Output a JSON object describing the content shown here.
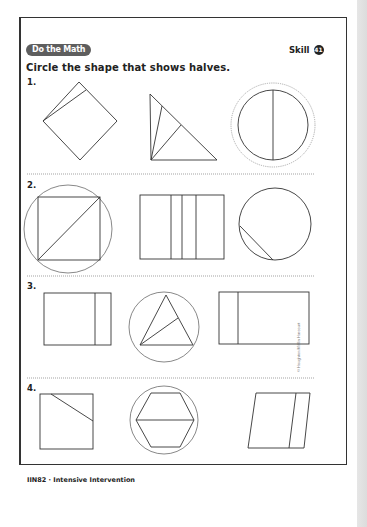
{
  "header": {
    "badge_label": "Do the Math",
    "skill_label": "Skill",
    "skill_number": "41"
  },
  "instructions": "Circle the shape that shows halves.",
  "problems": [
    {
      "number": "1.",
      "options": [
        {
          "shape": "square",
          "description": "square divided into two unequal parts",
          "circled": false
        },
        {
          "shape": "triangle",
          "description": "triangle divided into three unequal parts",
          "circled": false
        },
        {
          "shape": "circle",
          "description": "circle divided into two equal parts",
          "circled": true
        }
      ]
    },
    {
      "number": "2.",
      "options": [
        {
          "shape": "square",
          "description": "square divided by diagonal into two equal parts",
          "circled": true
        },
        {
          "shape": "rectangle",
          "description": "rectangle divided into four unequal parts",
          "circled": false
        },
        {
          "shape": "circle",
          "description": "circle with small segment cut off",
          "circled": false
        }
      ]
    },
    {
      "number": "3.",
      "options": [
        {
          "shape": "rectangle",
          "description": "rectangle divided into two unequal parts",
          "circled": false
        },
        {
          "shape": "triangle",
          "description": "triangle divided into two equal parts",
          "circled": true
        },
        {
          "shape": "rectangle",
          "description": "rectangle divided into two unequal parts",
          "circled": false
        }
      ]
    },
    {
      "number": "4.",
      "options": [
        {
          "shape": "square",
          "description": "square with corner cut off",
          "circled": false
        },
        {
          "shape": "hexagon",
          "description": "hexagon divided into two equal parts",
          "circled": true
        },
        {
          "shape": "parallelogram",
          "description": "parallelogram divided into two unequal parts",
          "circled": false
        }
      ]
    }
  ],
  "footer": "IIN82 · Intensive Intervention",
  "copyright": "© Houghton Mifflin Harcourt"
}
